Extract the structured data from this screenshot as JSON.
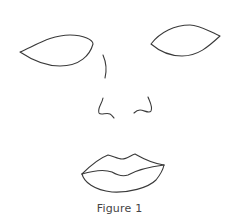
{
  "figure": {
    "caption": "Figure 1",
    "parts": [
      "left-eye",
      "right-eye",
      "nose-bridge",
      "left-nostril",
      "right-nostril",
      "lips"
    ],
    "stroke_color": "#3a3a3a",
    "background": "#ffffff"
  }
}
